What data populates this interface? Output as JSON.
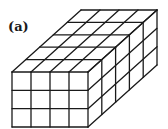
{
  "figure": {
    "label": "(a)",
    "grid": {
      "width_cells": 4,
      "height_cells": 3,
      "depth_cells": 5
    },
    "line_color": "#1a1a1a",
    "geometry": {
      "front_top_left": [
        12,
        72
      ],
      "front_width": 76,
      "front_height": 55,
      "depth_vector": [
        69,
        -62
      ]
    }
  }
}
